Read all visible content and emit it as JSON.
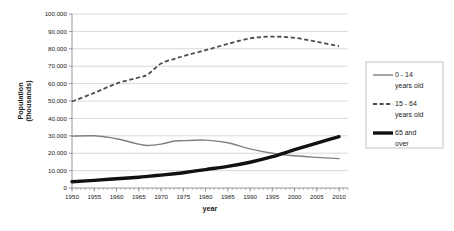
{
  "chart_data": {
    "type": "line",
    "title": "",
    "xlabel": "year",
    "ylabel": "Population (thousands)",
    "xlim": [
      1950,
      2012
    ],
    "ylim": [
      0,
      100000
    ],
    "grid": true,
    "legend_position": "right",
    "x_ticks": [
      1950,
      1955,
      1960,
      1965,
      1970,
      1975,
      1980,
      1985,
      1990,
      1995,
      2000,
      2005,
      2010
    ],
    "x_tick_labels": [
      "1950",
      "1955",
      "1960",
      "1965",
      "1970",
      "1975",
      "1980",
      "1985",
      "1990",
      "1995",
      "2000",
      "2005",
      "2010"
    ],
    "y_ticks": [
      0,
      10000,
      20000,
      30000,
      40000,
      50000,
      60000,
      70000,
      80000,
      90000,
      100000
    ],
    "y_tick_labels": [
      "0",
      "10,000",
      "20,000",
      "30,000",
      "40,000",
      "50,000",
      "60,000",
      "70,000",
      "80,000",
      "90,000",
      "100,000"
    ],
    "x": [
      1950,
      1955,
      1960,
      1965,
      1967,
      1970,
      1973,
      1975,
      1980,
      1985,
      1990,
      1995,
      2000,
      2005,
      2010
    ],
    "series": [
      {
        "name": "0 - 14 years old",
        "legend_label_line1": "0 - 14",
        "legend_label_line2": "years old",
        "style": "solid",
        "color": "#808080",
        "width": 1.4,
        "values": [
          29800,
          30000,
          28300,
          25200,
          24400,
          25200,
          27000,
          27200,
          27500,
          26000,
          22500,
          20000,
          18500,
          17600,
          16900
        ]
      },
      {
        "name": "15 - 64 years old",
        "legend_label_line1": "15 - 64",
        "legend_label_line2": "years old",
        "style": "dashed",
        "color": "#4d4d4d",
        "width": 1.8,
        "values": [
          49700,
          54700,
          60000,
          63500,
          65200,
          71500,
          74200,
          75800,
          79200,
          82800,
          86000,
          87000,
          86300,
          84000,
          81500
        ]
      },
      {
        "name": "65 and over",
        "legend_label_line1": "65 and",
        "legend_label_line2": "over",
        "style": "solid-thick",
        "color": "#111111",
        "width": 3.4,
        "values": [
          3600,
          4400,
          5300,
          6200,
          6700,
          7400,
          8200,
          8800,
          10600,
          12400,
          14800,
          18000,
          22000,
          25800,
          29500
        ]
      }
    ]
  },
  "legend": {
    "items": [
      {
        "label_line1": "0 - 14",
        "label_line2": "years old",
        "swatch": "thin-solid-line-icon"
      },
      {
        "label_line1": "15 - 64",
        "label_line2": "years old",
        "swatch": "dashed-line-icon"
      },
      {
        "label_line1": "65 and",
        "label_line2": "over",
        "swatch": "thick-solid-line-icon"
      }
    ]
  },
  "colors": {
    "background": "#ffffff",
    "grid": "#c9c9c9",
    "axis": "#8c8c8c",
    "text": "#1a1a1a",
    "legend_border": "#b5b5b5"
  }
}
